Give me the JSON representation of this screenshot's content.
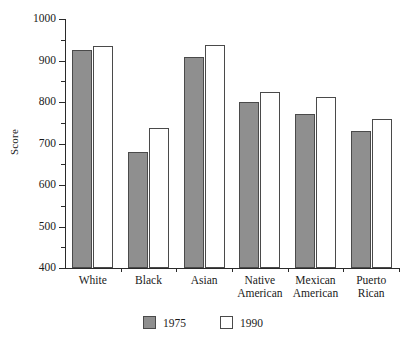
{
  "chart_data": {
    "type": "bar",
    "title": "",
    "xlabel": "",
    "ylabel": "Score",
    "ylim": [
      400,
      1000
    ],
    "ytick_step": 100,
    "yminor_step": 50,
    "grid": false,
    "legend_position": "bottom-center",
    "categories": [
      "White",
      "Black",
      "Asian",
      "Native American",
      "Mexican American",
      "Puerto Rican"
    ],
    "category_lines": [
      [
        "White"
      ],
      [
        "Black"
      ],
      [
        "Asian"
      ],
      [
        "Native",
        "American"
      ],
      [
        "Mexican",
        "American"
      ],
      [
        "Puerto",
        "Rican"
      ]
    ],
    "ytick_labels": [
      "1000",
      "900",
      "800",
      "700",
      "600",
      "500",
      "400"
    ],
    "ytick_values": [
      1000,
      900,
      800,
      700,
      600,
      500,
      400
    ],
    "yminor_values": [
      950,
      850,
      750,
      650,
      550,
      450
    ],
    "series": [
      {
        "name": "1975",
        "color": "#8f8f8f",
        "values": [
          925,
          680,
          908,
          800,
          770,
          731
        ]
      },
      {
        "name": "1990",
        "color": "#ffffff",
        "values": [
          935,
          738,
          938,
          823,
          813,
          760
        ]
      }
    ]
  },
  "axis": {
    "y_title": "Score"
  },
  "legend": {
    "items": [
      {
        "label": "1975",
        "style": "filled"
      },
      {
        "label": "1990",
        "style": "hollow"
      }
    ]
  },
  "colors": {
    "bar_1975_fill": "#8f8f8f",
    "bar_1990_fill": "#ffffff",
    "bar_stroke": "#4a4a4a",
    "axis": "#2a2a2a",
    "text": "#1a1a1a",
    "background": "#ffffff"
  }
}
